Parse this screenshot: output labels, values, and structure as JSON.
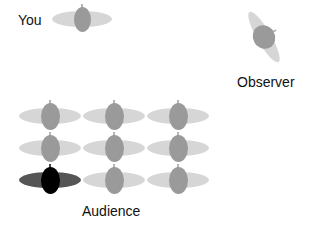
{
  "labels": {
    "you": "You",
    "observer": "Observer",
    "audience": "Audience"
  },
  "colors": {
    "shoulders": "#d6d6d6",
    "head": "#9a9a9a",
    "highlight_shoulders": "#555555",
    "highlight_head": "#000000"
  },
  "figures": {
    "you": {
      "cx": 82,
      "cy": 19,
      "rotation_deg": 0,
      "highlight": false
    },
    "observer": {
      "cx": 264,
      "cy": 37,
      "rotation_deg": 60,
      "highlight": false
    },
    "audience": [
      {
        "row": 1,
        "col": 1,
        "cx": 50,
        "cy": 116,
        "highlight": false
      },
      {
        "row": 1,
        "col": 2,
        "cx": 114,
        "cy": 116,
        "highlight": false
      },
      {
        "row": 1,
        "col": 3,
        "cx": 178,
        "cy": 116,
        "highlight": false
      },
      {
        "row": 2,
        "col": 1,
        "cx": 50,
        "cy": 148,
        "highlight": false
      },
      {
        "row": 2,
        "col": 2,
        "cx": 114,
        "cy": 148,
        "highlight": false
      },
      {
        "row": 2,
        "col": 3,
        "cx": 178,
        "cy": 148,
        "highlight": false
      },
      {
        "row": 3,
        "col": 1,
        "cx": 50,
        "cy": 180,
        "highlight": true
      },
      {
        "row": 3,
        "col": 2,
        "cx": 114,
        "cy": 180,
        "highlight": false
      },
      {
        "row": 3,
        "col": 3,
        "cx": 178,
        "cy": 180,
        "highlight": false
      }
    ]
  }
}
